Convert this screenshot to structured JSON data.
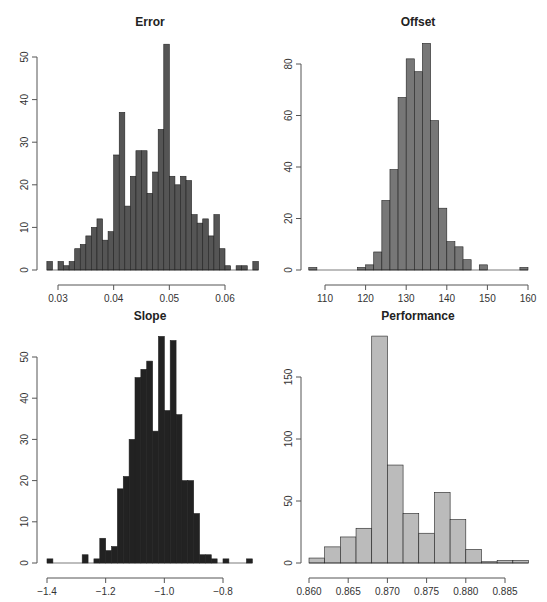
{
  "chart_data": [
    {
      "type": "bar",
      "subtype": "histogram",
      "title": "Error",
      "xlabel": "",
      "ylabel": "",
      "bar_color": "#555555",
      "bin_start": 0.028,
      "bin_width": 0.001,
      "values": [
        2,
        0,
        2,
        1,
        2,
        5,
        6,
        8,
        10,
        12,
        7,
        9,
        27,
        37,
        15,
        22,
        28,
        28,
        18,
        23,
        33,
        53,
        22,
        20,
        22,
        21,
        13,
        11,
        12,
        8,
        13,
        5,
        1,
        0,
        1,
        1,
        0,
        2
      ],
      "xticks": [
        "0.03",
        "0.04",
        "0.05",
        "0.06"
      ],
      "xtick_values": [
        0.03,
        0.04,
        0.05,
        0.06
      ],
      "yticks": [
        "0",
        "10",
        "20",
        "30",
        "40",
        "50"
      ],
      "ytick_values": [
        0,
        10,
        20,
        30,
        40,
        50
      ],
      "xlim": [
        0.028,
        0.067
      ],
      "ylim": [
        0,
        55
      ],
      "grid": false
    },
    {
      "type": "bar",
      "subtype": "histogram",
      "title": "Offset",
      "xlabel": "",
      "ylabel": "",
      "bar_color": "#777777",
      "bin_start": 106,
      "bin_width": 2,
      "values": [
        1,
        0,
        0,
        0,
        0,
        0,
        1,
        2,
        7,
        27,
        39,
        67,
        82,
        77,
        88,
        58,
        24,
        11,
        9,
        4,
        0,
        2,
        0,
        0,
        0,
        0,
        1
      ],
      "xticks": [
        "110",
        "120",
        "130",
        "140",
        "150",
        "160"
      ],
      "xtick_values": [
        110,
        120,
        130,
        140,
        150,
        160
      ],
      "yticks": [
        "0",
        "20",
        "40",
        "60",
        "80"
      ],
      "ytick_values": [
        0,
        20,
        40,
        60,
        80
      ],
      "xlim": [
        106,
        160
      ],
      "ylim": [
        0,
        90
      ],
      "grid": false
    },
    {
      "type": "bar",
      "subtype": "histogram",
      "title": "Slope",
      "xlabel": "",
      "ylabel": "",
      "bar_color": "#222222",
      "bin_start": -1.4,
      "bin_width": 0.02,
      "values": [
        1,
        0,
        0,
        0,
        0,
        0,
        2,
        0,
        1,
        6,
        3,
        4,
        18,
        21,
        30,
        45,
        47,
        49,
        32,
        55,
        37,
        54,
        36,
        20,
        20,
        12,
        2,
        2,
        1,
        0,
        1,
        0,
        0,
        0,
        1
      ],
      "xticks": [
        "−1.4",
        "−1.2",
        "−1.0",
        "−0.8"
      ],
      "xtick_values": [
        -1.4,
        -1.2,
        -1.0,
        -0.8
      ],
      "yticks": [
        "0",
        "10",
        "20",
        "30",
        "40",
        "50"
      ],
      "ytick_values": [
        0,
        10,
        20,
        30,
        40,
        50
      ],
      "xlim": [
        -1.4,
        -0.7
      ],
      "ylim": [
        0,
        56
      ],
      "grid": false
    },
    {
      "type": "bar",
      "subtype": "histogram",
      "title": "Performance",
      "xlabel": "",
      "ylabel": "",
      "bar_color": "#bbbbbb",
      "bin_start": 0.86,
      "bin_width": 0.002,
      "values": [
        4,
        13,
        21,
        28,
        183,
        79,
        40,
        24,
        57,
        35,
        11,
        1,
        2,
        2
      ],
      "xticks": [
        "0.860",
        "0.865",
        "0.870",
        "0.875",
        "0.880",
        "0.885"
      ],
      "xtick_values": [
        0.86,
        0.865,
        0.87,
        0.875,
        0.88,
        0.885
      ],
      "yticks": [
        "0",
        "50",
        "100",
        "150"
      ],
      "ytick_values": [
        0,
        50,
        100,
        150
      ],
      "xlim": [
        0.86,
        0.888
      ],
      "ylim": [
        0,
        185
      ],
      "grid": false
    }
  ],
  "layout": {
    "panels": [
      {
        "x0": 40,
        "x1": 266,
        "y0": 270,
        "ytop": 30,
        "xaxis_y": 285,
        "yaxis_x": 37,
        "title_y": 26,
        "px_xmin": 58,
        "px_xmax": 225,
        "vx_min": 0.03,
        "vx_max": 0.06,
        "px_ybase": 270,
        "px_ytop": 57,
        "vy_top": 50
      },
      {
        "x0": 304,
        "x1": 532,
        "y0": 270,
        "ytop": 30,
        "xaxis_y": 285,
        "yaxis_x": 301,
        "title_y": 26,
        "px_xmin": 325,
        "px_xmax": 528,
        "vx_min": 110,
        "vx_max": 160,
        "px_ybase": 270,
        "px_ytop": 64,
        "vy_top": 80
      },
      {
        "x0": 40,
        "x1": 266,
        "y0": 563,
        "ytop": 325,
        "xaxis_y": 578,
        "yaxis_x": 37,
        "title_y": 320,
        "px_xmin": 47,
        "px_xmax": 223,
        "vx_min": -1.4,
        "vx_max": -0.8,
        "px_ybase": 563,
        "px_ytop": 357,
        "vy_top": 50
      },
      {
        "x0": 304,
        "x1": 532,
        "y0": 563,
        "ytop": 325,
        "xaxis_y": 578,
        "yaxis_x": 301,
        "title_y": 320,
        "px_xmin": 309,
        "px_xmax": 505,
        "vx_min": 0.86,
        "vx_max": 0.885,
        "px_ybase": 563,
        "px_ytop": 377,
        "vy_top": 150
      }
    ]
  }
}
